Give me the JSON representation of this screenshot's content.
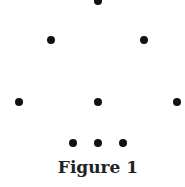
{
  "figure": {
    "caption": "Figure 1",
    "dot_color": "#111111",
    "dots": [
      {
        "x": 98,
        "y": 1
      },
      {
        "x": 51,
        "y": 40
      },
      {
        "x": 144,
        "y": 40
      },
      {
        "x": 19,
        "y": 102
      },
      {
        "x": 98,
        "y": 102
      },
      {
        "x": 177,
        "y": 102
      },
      {
        "x": 73,
        "y": 143
      },
      {
        "x": 98,
        "y": 143
      },
      {
        "x": 123,
        "y": 143
      }
    ]
  }
}
